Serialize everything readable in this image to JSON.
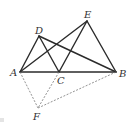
{
  "diagram": {
    "type": "geometry-figure",
    "points": {
      "A": {
        "label": "A",
        "x": 20,
        "y": 72
      },
      "B": {
        "label": "B",
        "x": 116,
        "y": 72
      },
      "C": {
        "label": "C",
        "x": 59,
        "y": 72
      },
      "D": {
        "label": "D",
        "x": 39,
        "y": 36
      },
      "E": {
        "label": "E",
        "x": 87,
        "y": 21
      },
      "F": {
        "label": "F",
        "x": 38,
        "y": 108
      }
    },
    "solid_segments": [
      "AB",
      "AD",
      "DC",
      "DB",
      "AE",
      "CE",
      "EB"
    ],
    "dashed_segments": [
      "AF",
      "CF",
      "FB"
    ],
    "colors": {
      "line": "#2b2b2b",
      "dashed": "#777777",
      "label": "#333333"
    }
  }
}
